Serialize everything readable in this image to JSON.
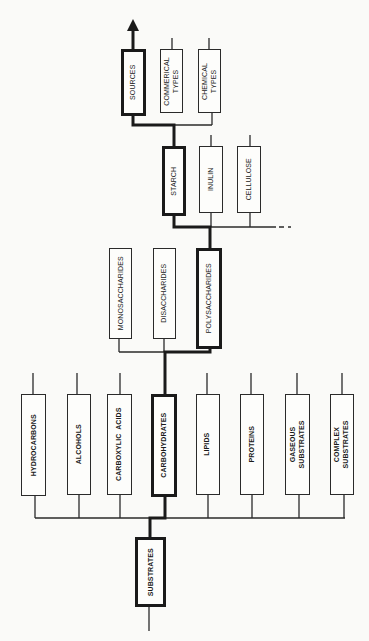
{
  "colors": {
    "line": "#2a2a2a",
    "bold_line": "#1a1a1a",
    "background": "#fafaf8"
  },
  "root": {
    "label": "SUBSTRATES",
    "highlighted": true
  },
  "level1": [
    {
      "label": "HYDROCARBONS",
      "highlighted": false
    },
    {
      "label": "ALCOHOLS",
      "highlighted": false
    },
    {
      "label": "CARBOXYLIC  ACIDS",
      "highlighted": false
    },
    {
      "label": "CARBOHYDRATES",
      "highlighted": true
    },
    {
      "label": "LIPIDS",
      "highlighted": false
    },
    {
      "label": "PROTEINS",
      "highlighted": false
    },
    {
      "label": "GASEOUS\nSUBSTRATES",
      "highlighted": false
    },
    {
      "label": "COMPLEX\nSUBSTRATES",
      "highlighted": false
    }
  ],
  "level2": [
    {
      "label": "MONOSACCHARIDES",
      "highlighted": false
    },
    {
      "label": "DISACCHARIDES",
      "highlighted": false
    },
    {
      "label": "POLYSACCHARIDES",
      "highlighted": true
    }
  ],
  "level3": [
    {
      "label": "STARCH",
      "highlighted": true
    },
    {
      "label": "INULIN",
      "highlighted": false
    },
    {
      "label": "CELLULOSE",
      "highlighted": false
    }
  ],
  "level4": [
    {
      "label": "SOURCES",
      "highlighted": true
    },
    {
      "label": "COMMERICAL\nTYPES",
      "highlighted": false
    },
    {
      "label": "CHEMICAL\nTYPES",
      "highlighted": false
    }
  ]
}
